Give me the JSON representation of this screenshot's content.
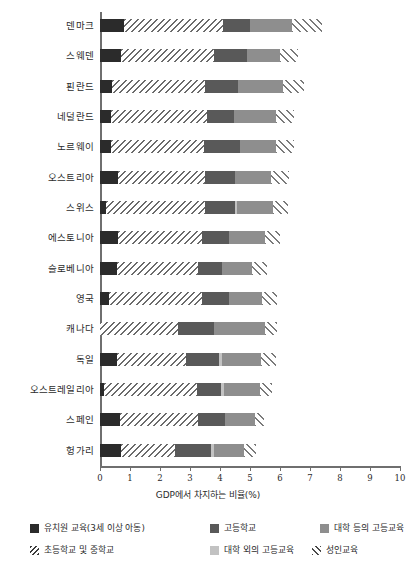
{
  "chart_data": {
    "type": "bar",
    "orientation": "horizontal",
    "stacked": true,
    "title": "",
    "subtitle": "",
    "xlabel": "GDP에서 차지하는 비율(%)",
    "ylabel": "",
    "xlim": [
      0,
      10
    ],
    "xticks": [
      0,
      1,
      2,
      3,
      4,
      5,
      6,
      7,
      8,
      9,
      10
    ],
    "xtick_labels": [
      "0",
      "1",
      "2",
      "3",
      "4",
      "5",
      "6",
      "7",
      "8",
      "9",
      "10"
    ],
    "grid": false,
    "legend_position": "bottom",
    "categories": [
      "덴마크",
      "스웨덴",
      "핀란드",
      "네덜란드",
      "노르웨이",
      "오스트리아",
      "스위스",
      "에스토니아",
      "슬로베니아",
      "영국",
      "캐나다",
      "독일",
      "오스트레일리아",
      "스페인",
      "헝가리"
    ],
    "series": [
      {
        "name": "유치원 교육(3세 이상 아동)",
        "key": "kinder",
        "color": "#2b2b2b",
        "pattern": "solid",
        "values": [
          0.8,
          0.7,
          0.4,
          0.35,
          0.35,
          0.6,
          0.2,
          0.6,
          0.55,
          0.3,
          0.0,
          0.55,
          0.12,
          0.65,
          0.7
        ]
      },
      {
        "name": "초등학교 및 중학교",
        "key": "primary",
        "color": "#d9d9d9",
        "pattern": "diagonal-forward",
        "values": [
          3.3,
          3.1,
          3.1,
          3.2,
          3.1,
          2.9,
          3.3,
          2.8,
          2.7,
          3.1,
          2.6,
          2.3,
          3.1,
          2.6,
          1.8
        ]
      },
      {
        "name": "고등학교",
        "key": "highschool",
        "color": "#595959",
        "pattern": "solid",
        "values": [
          0.9,
          1.1,
          1.1,
          0.9,
          1.2,
          1.0,
          1.0,
          0.9,
          0.8,
          0.9,
          1.2,
          1.1,
          0.8,
          0.9,
          1.2
        ]
      },
      {
        "name": "대학 외의 고등교육",
        "key": "nonuni",
        "color": "#c2c2c2",
        "pattern": "solid",
        "values": [
          0.0,
          0.0,
          0.0,
          0.0,
          0.0,
          0.0,
          0.05,
          0.0,
          0.0,
          0.0,
          0.0,
          0.1,
          0.1,
          0.0,
          0.1
        ]
      },
      {
        "name": "대학 등의 고등교육",
        "key": "uni",
        "color": "#8e8e8e",
        "pattern": "solid",
        "values": [
          1.4,
          1.1,
          1.5,
          1.4,
          1.2,
          1.2,
          1.2,
          1.2,
          1.0,
          1.1,
          1.7,
          1.3,
          1.2,
          1.0,
          1.0
        ]
      },
      {
        "name": "성인교육",
        "key": "adult",
        "color": "#ffffff",
        "pattern": "diagonal-back",
        "values": [
          1.0,
          0.6,
          0.7,
          0.6,
          0.6,
          0.6,
          0.5,
          0.5,
          0.5,
          0.5,
          0.4,
          0.5,
          0.4,
          0.3,
          0.4
        ]
      }
    ],
    "totals": [
      7.4,
      6.6,
      6.8,
      6.45,
      6.45,
      6.3,
      6.25,
      6.0,
      5.55,
      5.9,
      5.9,
      5.85,
      5.72,
      5.45,
      5.2
    ]
  },
  "legend": {
    "items": [
      {
        "label": "유치원 교육(3세 이상 아동)",
        "key": "kinder",
        "swatch": "solid-dark"
      },
      {
        "label": "고등학교",
        "key": "highschool",
        "swatch": "solid-mid"
      },
      {
        "label": "대학 등의 고등교육",
        "key": "uni",
        "swatch": "solid-gray"
      },
      {
        "label": "초등학교 및 중학교",
        "key": "primary",
        "swatch": "hatch-forward"
      },
      {
        "label": "대학 외의 고등교육",
        "key": "nonuni",
        "swatch": "solid-light"
      },
      {
        "label": "성인교육",
        "key": "adult",
        "swatch": "hatch-back"
      }
    ]
  }
}
